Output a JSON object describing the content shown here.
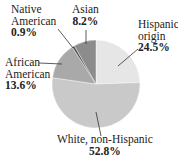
{
  "chart_data": {
    "type": "pie",
    "title": "",
    "categories": [
      "Hispanic origin",
      "White, non-Hispanic",
      "African American",
      "Native American",
      "Asian"
    ],
    "values": [
      24.5,
      52.8,
      13.6,
      0.9,
      8.2
    ],
    "unit": "%",
    "start_angle": "12 o'clock, clockwise",
    "colors": [
      "#e6e6e6",
      "#c9c9c9",
      "#a9a9a9",
      "#505050",
      "#8c8c8c"
    ],
    "legend": "none (direct labels with leader lines)"
  },
  "labels": {
    "hispanic": {
      "line1": "Hispanic",
      "line2": "origin",
      "value": "24.5%"
    },
    "white": {
      "line1": "White, non-Hispanic",
      "value": "52.8%"
    },
    "african": {
      "line1": "African",
      "line2": "American",
      "value": "13.6%"
    },
    "native": {
      "line1": "Native",
      "line2": "American",
      "value": "0.9%"
    },
    "asian": {
      "line1": "Asian",
      "value": "8.2%"
    }
  }
}
